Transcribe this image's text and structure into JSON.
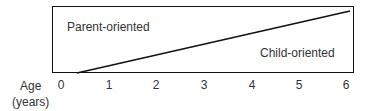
{
  "diagram": {
    "top_label": "Parent-oriented",
    "bottom_label": "Child-oriented",
    "axis": {
      "title_line1": "Age",
      "title_line2": "(years)",
      "ticks": [
        "0",
        "1",
        "2",
        "3",
        "4",
        "5",
        "6"
      ]
    },
    "line": {
      "from_age": 0.3,
      "to_age": 6.0,
      "from_level": 0,
      "to_level": 0.95
    },
    "colors": {
      "stroke": "#111111",
      "text": "#333333"
    }
  }
}
